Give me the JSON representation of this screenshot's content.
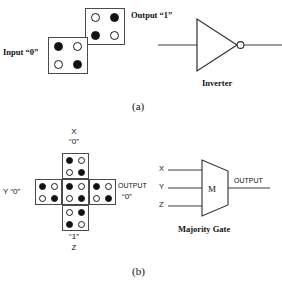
{
  "figure": {
    "panels": [
      {
        "id": "a",
        "caption": "(a)",
        "device_name": "Inverter",
        "cells": [
          {
            "name": "input-cell",
            "label": "Input “0”",
            "value": "0",
            "polarization": "diagonal-nw-se",
            "dots": [
              "filled",
              "empty",
              "empty",
              "filled"
            ]
          },
          {
            "name": "output-cell",
            "label": "Output “1”",
            "value": "1",
            "polarization": "diagonal-ne-sw",
            "dots": [
              "empty",
              "filled",
              "filled",
              "empty"
            ]
          }
        ]
      },
      {
        "id": "b",
        "caption": "(b)",
        "device_name": "Majority Gate",
        "gate_letter": "M",
        "gate_inputs": [
          "X",
          "Y",
          "Z"
        ],
        "gate_output": "OUTPUT",
        "labels": {
          "x_name": "X",
          "x_value": "“0”",
          "y_text": "Y “0”",
          "z_value": "“1”",
          "z_name": "Z",
          "output_name": "OUTPUT",
          "output_value": "“0”"
        },
        "cells": [
          {
            "name": "cell-x-input",
            "position": "top",
            "value": "0",
            "polarization": "diagonal-nw-se",
            "dots": [
              "filled",
              "empty",
              "empty",
              "filled"
            ]
          },
          {
            "name": "cell-y-input",
            "position": "left",
            "value": "0",
            "polarization": "diagonal-nw-se",
            "dots": [
              "filled",
              "empty",
              "empty",
              "filled"
            ]
          },
          {
            "name": "cell-device",
            "position": "center",
            "value": "0",
            "polarization": "diagonal-nw-se",
            "dots": [
              "filled",
              "empty",
              "empty",
              "filled"
            ]
          },
          {
            "name": "cell-output",
            "position": "right",
            "value": "0",
            "polarization": "diagonal-nw-se",
            "dots": [
              "filled",
              "empty",
              "empty",
              "filled"
            ]
          },
          {
            "name": "cell-z-input",
            "position": "bottom",
            "value": "1",
            "polarization": "diagonal-ne-sw",
            "dots": [
              "empty",
              "filled",
              "filled",
              "empty"
            ]
          }
        ]
      }
    ]
  }
}
